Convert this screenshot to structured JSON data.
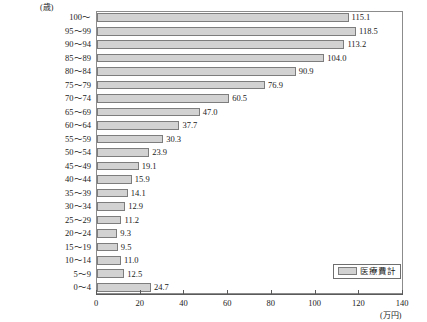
{
  "chart_data": {
    "type": "bar",
    "orientation": "horizontal",
    "title": "",
    "xlabel": "(万円)",
    "ylabel": "(歳)",
    "xlim": [
      0,
      140
    ],
    "xticks": [
      0,
      20,
      40,
      60,
      80,
      100,
      120,
      140
    ],
    "grid": false,
    "legend_position": "bottom-right",
    "series": [
      {
        "name": "医療費計",
        "categories": [
          "100〜",
          "95〜99",
          "90〜94",
          "85〜89",
          "80〜84",
          "75〜79",
          "70〜74",
          "65〜69",
          "60〜64",
          "55〜59",
          "50〜54",
          "45〜49",
          "40〜44",
          "35〜39",
          "30〜34",
          "25〜29",
          "20〜24",
          "15〜19",
          "10〜14",
          "5〜9",
          "0〜4"
        ],
        "values": [
          115.1,
          118.5,
          113.2,
          104.0,
          90.9,
          76.9,
          60.5,
          47.0,
          37.7,
          30.3,
          23.9,
          19.1,
          15.9,
          14.1,
          12.9,
          11.2,
          9.3,
          9.5,
          11.0,
          12.5,
          24.7
        ],
        "value_labels": [
          "115.1",
          "118.5",
          "113.2",
          "104.0",
          "90.9",
          "76.9",
          "60.5",
          "47.0",
          "37.7",
          "30.3",
          "23.9",
          "19.1",
          "15.9",
          "14.1",
          "12.9",
          "11.2",
          "9.3",
          "9.5",
          "11.0",
          "12.5",
          "24.7"
        ]
      }
    ],
    "colors": {
      "bar_fill": "#d2d2d2",
      "bar_border": "#7d7d7d",
      "axis": "#5a5a5a",
      "frame": "#8c8c8c",
      "text": "#1a1a1a"
    }
  },
  "legend": {
    "items": [
      {
        "label": "医療費計"
      }
    ]
  },
  "axes": {
    "y_unit": "(歳)",
    "x_unit": "(万円)",
    "x_tick_labels": [
      "0",
      "20",
      "40",
      "60",
      "80",
      "100",
      "120",
      "140"
    ]
  }
}
